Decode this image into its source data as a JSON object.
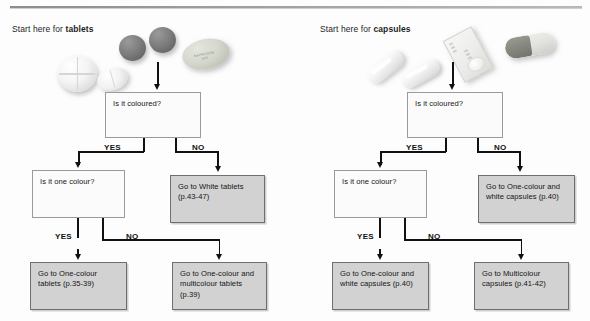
{
  "columns": [
    {
      "id": "tablets",
      "start_label_prefix": "Start here for ",
      "start_label_strong": "tablets",
      "decision_1": "Is it coloured?",
      "decision_1_yes": "YES",
      "decision_1_no": "NO",
      "decision_2": "Is it one colour?",
      "decision_2_yes": "YES",
      "decision_2_no": "NO",
      "outcome_no_colour": "Go to White tablets (p.43-47)",
      "outcome_one_colour": "Go to One-colour tablets (p.35-39)",
      "outcome_multicolour": "Go to One-colour and multicolour tablets (p.39)",
      "artwork": {
        "caplet_emboss_line1": "NAPROXEN",
        "caplet_emboss_line2": "500"
      }
    },
    {
      "id": "capsules",
      "start_label_prefix": "Start here for ",
      "start_label_strong": "capsules",
      "decision_1": "Is it coloured?",
      "decision_1_yes": "YES",
      "decision_1_no": "NO",
      "decision_2": "Is it one colour?",
      "decision_2_yes": "YES",
      "decision_2_no": "NO",
      "outcome_no_colour": "Go to One-colour and white capsules (p.40)",
      "outcome_one_colour": "Go to One-colour and white capsules (p.40)",
      "outcome_multicolour": "Go to Multicolour capsules (p.41-42)",
      "artwork": {
        "blister_text_1": "|||||\n|||||\n|||||",
        "blister_text_2": "|||||\n|||||\n|||||"
      }
    }
  ],
  "colors": {
    "box_fill_plain": "#fbfbfb",
    "box_fill_filled": "#d2d2d2",
    "box_border": "#8a8a8a",
    "connector": "#111111",
    "text": "#151515"
  }
}
